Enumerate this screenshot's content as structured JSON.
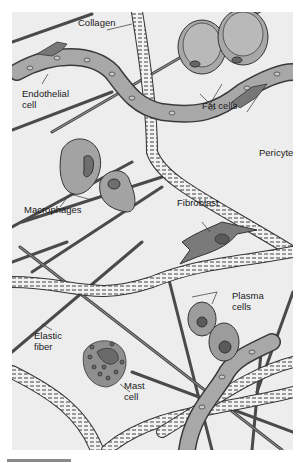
{
  "figure": {
    "labels": {
      "collagen": "Collagen",
      "endothelial_cell": "Endothelial\ncell",
      "fat_cells": "Fat cells",
      "pericyte": "Pericyte",
      "macrophages": "Macrophages",
      "fibroblast": "Fibroblast",
      "plasma_cells": "Plasma\ncells",
      "elastic_fiber": "Elastic\nfiber",
      "mast_cell": "Mast\ncell"
    },
    "colors": {
      "background": "#ededed",
      "cell_fill": "#9c9c9c",
      "cell_light": "#b5b5b5",
      "nucleus": "#6e6e6e",
      "fiber_dark": "#555555",
      "outline": "#3a3a3a",
      "scale_bar": "#8a8a8a"
    }
  }
}
